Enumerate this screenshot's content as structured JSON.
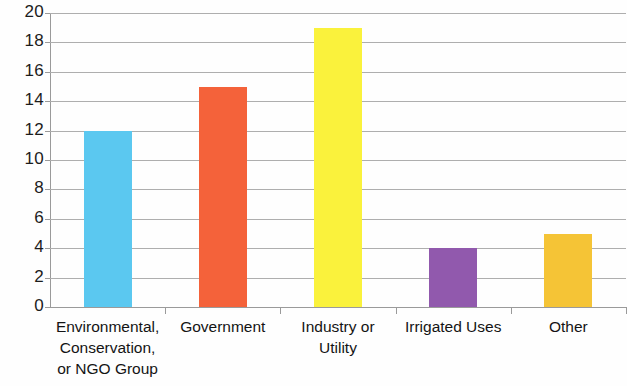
{
  "chart_data": {
    "type": "bar",
    "title": "",
    "subtitle": "",
    "xlabel": "",
    "ylabel": "",
    "categories": [
      "Environmental, Conservation, or NGO Group",
      "Government",
      "Industry or Utility",
      "Irrigated Uses",
      "Other"
    ],
    "category_lines": [
      [
        "Environmental,",
        "Conservation,",
        "or NGO Group"
      ],
      [
        "Government"
      ],
      [
        "Industry or",
        "Utility"
      ],
      [
        "Irrigated Uses"
      ],
      [
        "Other"
      ]
    ],
    "values": [
      12,
      15,
      19,
      4,
      5
    ],
    "bar_colors": [
      "#5BC8F0",
      "#F4623A",
      "#FAF23C",
      "#9159AD",
      "#F5C436"
    ],
    "ylim": [
      0,
      20
    ],
    "ytick_step": 2,
    "ytick_labels": [
      "20",
      "18",
      "16",
      "14",
      "12",
      "10",
      "8",
      "6",
      "4",
      "2",
      "0"
    ],
    "ytick_values": [
      20,
      18,
      16,
      14,
      12,
      10,
      8,
      6,
      4,
      2,
      0
    ],
    "grid": true,
    "grid_color": "#aeaeae",
    "legend": false,
    "legend_position": "none",
    "background": "#fefefe"
  }
}
